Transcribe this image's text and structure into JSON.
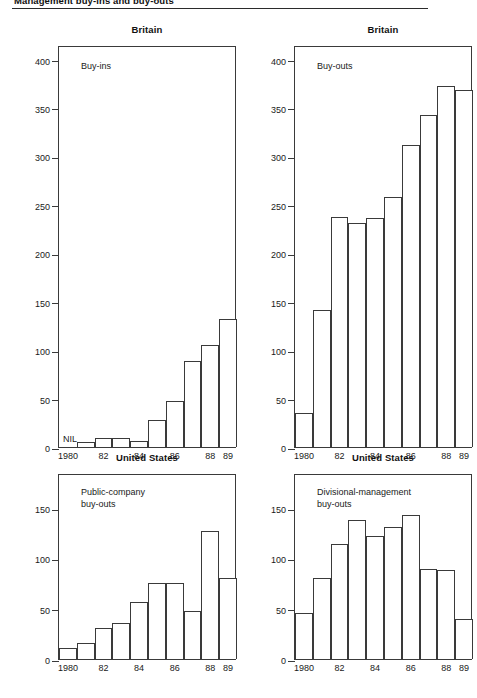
{
  "figure": {
    "title": "Management buy-ins and buy-outs",
    "rule_color": "#2b2b2b"
  },
  "chart_data": [
    {
      "id": "britain-buy-ins",
      "type": "bar",
      "title": "Britain",
      "annotation": "Buy-ins",
      "zero_annotation": "NIL",
      "xlabel": "",
      "ylabel": "",
      "ylim": [
        0,
        415
      ],
      "yticks": [
        0,
        50,
        100,
        150,
        200,
        250,
        300,
        350,
        400
      ],
      "ytick_labels": [
        "0",
        "50",
        "100",
        "150",
        "200",
        "250",
        "300",
        "350",
        "400"
      ],
      "grid": false,
      "legend": "none",
      "x": [
        1980,
        1981,
        1982,
        1983,
        1984,
        1985,
        1986,
        1987,
        1988,
        1989
      ],
      "xtick_labels": [
        "1980",
        "82",
        "84",
        "86",
        "88",
        "89"
      ],
      "xtick_positions": [
        1980,
        1982,
        1984,
        1986,
        1988,
        1989
      ],
      "categories": [
        "1980",
        "1981",
        "1982",
        "1983",
        "1984",
        "1985",
        "1986",
        "1987",
        "1988",
        "1989"
      ],
      "values": [
        0,
        5,
        9,
        9,
        6,
        28,
        48,
        89,
        105,
        132
      ]
    },
    {
      "id": "britain-buy-outs",
      "type": "bar",
      "title": "Britain",
      "annotation": "Buy-outs",
      "xlabel": "",
      "ylabel": "",
      "ylim": [
        0,
        415
      ],
      "yticks": [
        0,
        50,
        100,
        150,
        200,
        250,
        300,
        350,
        400
      ],
      "ytick_labels": [
        "0",
        "50",
        "100",
        "150",
        "200",
        "250",
        "300",
        "350",
        "400"
      ],
      "grid": false,
      "legend": "none",
      "x": [
        1980,
        1981,
        1982,
        1983,
        1984,
        1985,
        1986,
        1987,
        1988,
        1989
      ],
      "xtick_labels": [
        "1980",
        "82",
        "84",
        "86",
        "88",
        "89"
      ],
      "xtick_positions": [
        1980,
        1982,
        1984,
        1986,
        1988,
        1989
      ],
      "categories": [
        "1980",
        "1981",
        "1982",
        "1983",
        "1984",
        "1985",
        "1986",
        "1987",
        "1988",
        "1989"
      ],
      "values": [
        35,
        141,
        237,
        231,
        236,
        258,
        312,
        343,
        373,
        369
      ]
    },
    {
      "id": "us-public-company-buy-outs",
      "type": "bar",
      "title": "United States",
      "annotation": "Public-company\nbuy-outs",
      "xlabel": "",
      "ylabel": "",
      "ylim": [
        0,
        185
      ],
      "yticks": [
        0,
        50,
        100,
        150
      ],
      "ytick_labels": [
        "0",
        "50",
        "100",
        "150"
      ],
      "grid": false,
      "legend": "none",
      "x": [
        1980,
        1981,
        1982,
        1983,
        1984,
        1985,
        1986,
        1987,
        1988,
        1989
      ],
      "xtick_labels": [
        "1980",
        "82",
        "84",
        "86",
        "88",
        "89"
      ],
      "xtick_positions": [
        1980,
        1982,
        1984,
        1986,
        1988,
        1989
      ],
      "categories": [
        "1980",
        "1981",
        "1982",
        "1983",
        "1984",
        "1985",
        "1986",
        "1987",
        "1988",
        "1989"
      ],
      "values": [
        11,
        16,
        31,
        36,
        57,
        76,
        76,
        48,
        127,
        81
      ]
    },
    {
      "id": "us-divisional-management-buy-outs",
      "type": "bar",
      "title": "United States",
      "annotation": "Divisional-management\nbuy-outs",
      "xlabel": "",
      "ylabel": "",
      "ylim": [
        0,
        185
      ],
      "yticks": [
        0,
        50,
        100,
        150
      ],
      "ytick_labels": [
        "0",
        "50",
        "100",
        "150"
      ],
      "grid": false,
      "legend": "none",
      "x": [
        1980,
        1981,
        1982,
        1983,
        1984,
        1985,
        1986,
        1987,
        1988,
        1989
      ],
      "xtick_labels": [
        "1980",
        "82",
        "84",
        "86",
        "88",
        "89"
      ],
      "xtick_positions": [
        1980,
        1982,
        1984,
        1986,
        1988,
        1989
      ],
      "categories": [
        "1980",
        "1981",
        "1982",
        "1983",
        "1984",
        "1985",
        "1986",
        "1987",
        "1988",
        "1989"
      ],
      "values": [
        46,
        81,
        114,
        138,
        122,
        131,
        143,
        90,
        89,
        40
      ]
    }
  ],
  "style": {
    "axis_color": "#3a3a3a",
    "bar_fill": "#ffffff",
    "bar_stroke": "#3a3a3a",
    "text_color": "#1a1a1a"
  }
}
